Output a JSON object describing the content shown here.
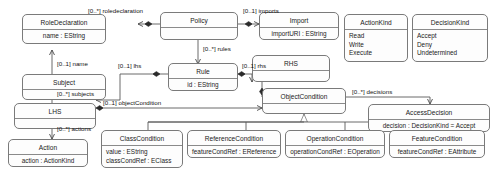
{
  "diagram": {
    "kind": "uml-class-diagram",
    "line_color": "#5a5a5a",
    "box_border": "#7a7a7a",
    "box_fill": "#fdfdfd",
    "text_color": "#1b1b1b"
  },
  "classes": [
    {
      "id": "roledeclaration",
      "name": "RoleDeclaration",
      "attributes": [
        "name : EString"
      ]
    },
    {
      "id": "subject",
      "name": "Subject",
      "attributes": []
    },
    {
      "id": "lhs",
      "name": "LHS",
      "attributes": []
    },
    {
      "id": "action",
      "name": "Action",
      "attributes": [
        "action : ActionKind"
      ]
    },
    {
      "id": "policy",
      "name": "Policy",
      "attributes": []
    },
    {
      "id": "rule",
      "name": "Rule",
      "attributes": [
        "id : EString"
      ]
    },
    {
      "id": "import",
      "name": "Import",
      "attributes": [
        "importURI : EString"
      ]
    },
    {
      "id": "rhs",
      "name": "RHS",
      "attributes": []
    },
    {
      "id": "objectcondition",
      "name": "ObjectCondition",
      "attributes": []
    },
    {
      "id": "accessdecision",
      "name": "AccessDecision",
      "attributes": [
        "decision : DecisionKind = Accept"
      ]
    },
    {
      "id": "classcondition",
      "name": "ClassCondition",
      "attributes": [
        "value : EString",
        "classCondRef : EClass"
      ]
    },
    {
      "id": "referencecondition",
      "name": "ReferenceCondition",
      "attributes": [
        "featureCondRef : EReference"
      ]
    },
    {
      "id": "operationcondition",
      "name": "OperationCondition",
      "attributes": [
        "operationCondRef : EOperation"
      ]
    },
    {
      "id": "featurecondition",
      "name": "FeatureCondition",
      "attributes": [
        "featureCondRef : EAttribute"
      ]
    }
  ],
  "enumerations": [
    {
      "id": "actionkind",
      "name": "ActionKind",
      "literals": [
        "Read",
        "Write",
        "Execute"
      ]
    },
    {
      "id": "decisionkind",
      "name": "DecisionKind",
      "literals": [
        "Accept",
        "Deny",
        "Undetermined"
      ]
    }
  ],
  "associations": [
    {
      "id": "a-roledeclaration",
      "label": "[0..*] roledeclaration",
      "from": "policy",
      "to": "roledeclaration"
    },
    {
      "id": "a-imports",
      "label": "[0..1] imports",
      "from": "policy",
      "to": "import"
    },
    {
      "id": "a-rules",
      "label": "[0..*] rules",
      "from": "policy",
      "to": "rule"
    },
    {
      "id": "a-lhs",
      "label": "[0..1] lhs",
      "from": "rule",
      "to": "lhs"
    },
    {
      "id": "a-rhs",
      "label": "[0..1] rhs",
      "from": "rule",
      "to": "rhs"
    },
    {
      "id": "a-name",
      "label": "[0..1] name",
      "from": "subject",
      "to": "roledeclaration"
    },
    {
      "id": "a-subjects",
      "label": "[0..*] subjects",
      "from": "lhs",
      "to": "subject"
    },
    {
      "id": "a-actions",
      "label": "[0..*] actions",
      "from": "lhs",
      "to": "action"
    },
    {
      "id": "a-objectcondition",
      "label": "[0..1] objectCondition",
      "from": "lhs",
      "to": "objectcondition"
    },
    {
      "id": "a-decisions",
      "label": "[0..*] decisions",
      "from": "rhs",
      "to": "accessdecision"
    }
  ],
  "generalizations": [
    {
      "id": "g-classcondition",
      "child": "classcondition",
      "parent": "objectcondition"
    },
    {
      "id": "g-referencecondition",
      "child": "referencecondition",
      "parent": "objectcondition"
    },
    {
      "id": "g-operationcondition",
      "child": "operationcondition",
      "parent": "objectcondition"
    },
    {
      "id": "g-featurecondition",
      "child": "featurecondition",
      "parent": "objectcondition"
    }
  ]
}
